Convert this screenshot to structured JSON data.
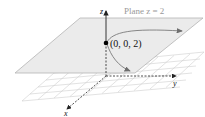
{
  "diagram": {
    "plane_label": "Plane z = 2",
    "point_label": "(0, 0, 2)",
    "axes": {
      "x": "x",
      "y": "y",
      "z": "z"
    },
    "colors": {
      "plane_fill": "#ebebeb",
      "plane_edge": "#b4b4b4",
      "grid": "#c8c8c8",
      "curve": "#7a7a7a",
      "axis": "#222222",
      "point": "#000000",
      "plane_label": "#999999"
    }
  }
}
